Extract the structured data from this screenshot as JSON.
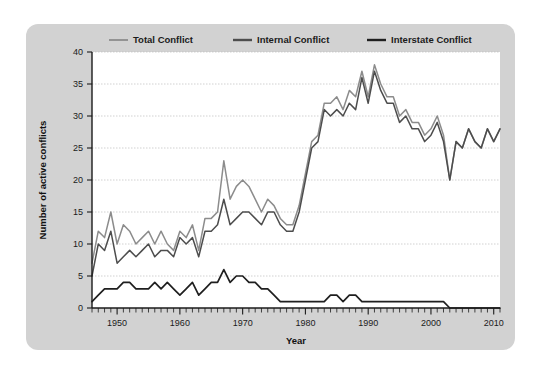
{
  "panel": {
    "background_color": "#d2d2d2",
    "plot_background_color": "#ffffff"
  },
  "legend": {
    "position": "top-center",
    "items": [
      {
        "label": "Total Conflict",
        "color": "#8c8c8c",
        "swatch_name": "legend-swatch-total"
      },
      {
        "label": "Internal Conflict",
        "color": "#4d4d4d",
        "swatch_name": "legend-swatch-internal"
      },
      {
        "label": "Interstate Conflict",
        "color": "#1f1f1f",
        "swatch_name": "legend-swatch-interstate"
      }
    ]
  },
  "axes": {
    "x_title": "Year",
    "y_title": "Number of active conflicts",
    "x_tick_labels": [
      "1950",
      "1960",
      "1970",
      "1980",
      "1990",
      "2000",
      "2010"
    ],
    "x_tick_values": [
      1950,
      1960,
      1970,
      1980,
      1990,
      2000,
      2010
    ],
    "y_tick_labels": [
      "0",
      "5",
      "10",
      "15",
      "20",
      "25",
      "30",
      "35",
      "40"
    ],
    "y_tick_values": [
      0,
      5,
      10,
      15,
      20,
      25,
      30,
      35,
      40
    ]
  },
  "chart_data": {
    "type": "line",
    "title": "",
    "xlabel": "Year",
    "ylabel": "Number of active conflicts",
    "xlim": [
      1946,
      2011
    ],
    "ylim": [
      0,
      40
    ],
    "grid": true,
    "grid_axis": "y",
    "legend_position": "top-center",
    "x": [
      1946,
      1947,
      1948,
      1949,
      1950,
      1951,
      1952,
      1953,
      1954,
      1955,
      1956,
      1957,
      1958,
      1959,
      1960,
      1961,
      1962,
      1963,
      1964,
      1965,
      1966,
      1967,
      1968,
      1969,
      1970,
      1971,
      1972,
      1973,
      1974,
      1975,
      1976,
      1977,
      1978,
      1979,
      1980,
      1981,
      1982,
      1983,
      1984,
      1985,
      1986,
      1987,
      1988,
      1989,
      1990,
      1991,
      1992,
      1993,
      1994,
      1995,
      1996,
      1997,
      1998,
      1999,
      2000,
      2001,
      2002,
      2003,
      2004,
      2005,
      2006,
      2007,
      2008,
      2009,
      2010,
      2011
    ],
    "series": [
      {
        "name": "Total Conflict",
        "color": "#8c8c8c",
        "values": [
          7,
          12,
          11,
          15,
          10,
          13,
          12,
          10,
          11,
          12,
          10,
          12,
          10,
          9,
          12,
          11,
          13,
          9,
          14,
          14,
          15,
          23,
          17,
          19,
          20,
          19,
          17,
          15,
          17,
          16,
          14,
          13,
          13,
          16,
          21,
          26,
          27,
          32,
          32,
          33,
          31,
          34,
          33,
          37,
          33,
          38,
          35,
          33,
          33,
          30,
          31,
          29,
          29,
          27,
          28,
          30,
          27,
          20,
          26,
          25,
          28,
          26,
          25,
          28,
          26,
          28
        ]
      },
      {
        "name": "Internal Conflict",
        "color": "#4d4d4d",
        "values": [
          5,
          10,
          9,
          12,
          7,
          8,
          9,
          8,
          9,
          10,
          8,
          9,
          9,
          8,
          11,
          10,
          11,
          8,
          12,
          12,
          13,
          17,
          13,
          14,
          15,
          15,
          14,
          13,
          15,
          15,
          13,
          12,
          12,
          15,
          20,
          25,
          26,
          31,
          30,
          31,
          30,
          32,
          31,
          36,
          32,
          37,
          34,
          32,
          32,
          29,
          30,
          28,
          28,
          26,
          27,
          29,
          26,
          20,
          26,
          25,
          28,
          26,
          25,
          28,
          26,
          28
        ]
      },
      {
        "name": "Interstate Conflict",
        "color": "#1f1f1f",
        "values": [
          1,
          2,
          3,
          3,
          3,
          4,
          4,
          3,
          3,
          3,
          4,
          3,
          4,
          3,
          2,
          3,
          4,
          2,
          3,
          4,
          4,
          6,
          4,
          5,
          5,
          4,
          4,
          3,
          3,
          2,
          1,
          1,
          1,
          1,
          1,
          1,
          1,
          1,
          2,
          2,
          1,
          2,
          2,
          1,
          1,
          1,
          1,
          1,
          1,
          1,
          1,
          1,
          1,
          1,
          1,
          1,
          1,
          0,
          0,
          0,
          0,
          0,
          0,
          0,
          0,
          0
        ]
      }
    ]
  }
}
